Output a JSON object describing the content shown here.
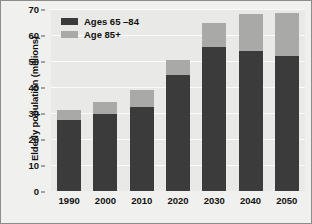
{
  "chart_data": {
    "type": "bar",
    "stacked": true,
    "title": "",
    "xlabel": "",
    "ylabel": "Elderly population (millions)",
    "categories": [
      "1990",
      "2000",
      "2010",
      "2020",
      "2030",
      "2040",
      "2050"
    ],
    "series": [
      {
        "name": "Ages 65 –84",
        "color": "#3b3b3b",
        "values": [
          27.5,
          29.8,
          32.5,
          44.5,
          55.5,
          54.0,
          52.0
        ]
      },
      {
        "name": "Age 85+",
        "color": "#a9a9a7",
        "values": [
          3.5,
          4.5,
          6.5,
          6.0,
          9.0,
          14.0,
          16.5
        ]
      }
    ],
    "totals": [
      31.0,
      34.3,
      39.0,
      50.5,
      64.5,
      68.0,
      68.5
    ],
    "ylim": [
      0,
      70
    ],
    "yticks": [
      0,
      10,
      20,
      30,
      40,
      50,
      60,
      70
    ],
    "ytick_labels": [
      "0",
      "10",
      "20",
      "30",
      "40",
      "50",
      "60",
      "70"
    ],
    "grid": true,
    "legend_position": "upper-left",
    "plot_background": "#e9e9e7",
    "gridline_color": "#fbfbfb",
    "figure_background": "#f0f0ee",
    "border_color": "#8d8d8d"
  }
}
